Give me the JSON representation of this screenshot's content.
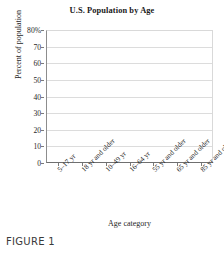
{
  "chart_data": {
    "type": "bar",
    "title": "U.S. Population by Age",
    "xlabel": "Age category",
    "ylabel": "Percent of population",
    "categories": [
      "5–17 yr",
      "18 yr and older",
      "10–49 yr",
      "16–64 yr",
      "55 yr and older",
      "65 yr and older",
      "85 yr and older"
    ],
    "values": [
      null,
      null,
      null,
      null,
      null,
      null,
      null
    ],
    "ylim": [
      0,
      80
    ],
    "ytick_values": [
      0,
      10,
      20,
      30,
      40,
      50,
      60,
      70,
      80
    ],
    "ytick_labels": [
      "0",
      "10",
      "20",
      "30",
      "40",
      "50",
      "60",
      "70",
      "80%"
    ],
    "grid": true,
    "legend": "none"
  },
  "caption": {
    "text": "FIGURE 1"
  },
  "colors": {
    "gridline": "#dcdcdc",
    "axis": "#6f6f6f",
    "text": "#1f1f1f",
    "plot_background": "#ffffff"
  }
}
